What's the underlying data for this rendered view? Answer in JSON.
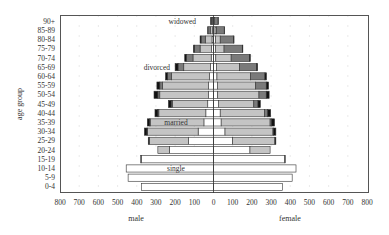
{
  "chart_data": {
    "type": "bar",
    "subtype": "population-pyramid-stacked",
    "title": "",
    "ylabel": "age group",
    "xlabel_left": "male",
    "xlabel_right": "female",
    "xlim": [
      -800,
      800
    ],
    "xticks": [
      "800",
      "700",
      "600",
      "500",
      "400",
      "300",
      "200",
      "100",
      "0",
      "100",
      "200",
      "300",
      "400",
      "500",
      "600",
      "700",
      "800"
    ],
    "grid": "dotted vertical",
    "legend": "inline annotations",
    "annotations": [
      {
        "text": "widowed",
        "age": "90+"
      },
      {
        "text": "divorced",
        "age": "65-69"
      },
      {
        "text": "married",
        "age": "35-39"
      },
      {
        "text": "single",
        "age": "10-14"
      }
    ],
    "categories": [
      "0-4",
      "5-9",
      "10-14",
      "15-19",
      "20-24",
      "25-29",
      "30-34",
      "35-39",
      "40-44",
      "45-49",
      "50-54",
      "55-59",
      "60-64",
      "65-69",
      "70-74",
      "75-79",
      "80-84",
      "85-89",
      "90+"
    ],
    "segment_order": [
      "single",
      "married",
      "widowed",
      "divorced"
    ],
    "colors": {
      "single": "#ffffff",
      "married": "#c4c4c4",
      "widowed": "#7a7a7a",
      "divorced": "#111111"
    },
    "male": {
      "single": [
        375,
        445,
        455,
        375,
        230,
        130,
        80,
        50,
        40,
        30,
        25,
        25,
        20,
        15,
        12,
        10,
        8,
        5,
        2
      ],
      "married": [
        0,
        0,
        0,
        5,
        60,
        205,
        265,
        280,
        245,
        185,
        255,
        240,
        200,
        140,
        95,
        60,
        35,
        12,
        2
      ],
      "widowed": [
        0,
        0,
        0,
        0,
        0,
        0,
        2,
        3,
        5,
        6,
        10,
        15,
        20,
        30,
        35,
        30,
        22,
        12,
        8
      ],
      "divorced": [
        0,
        0,
        0,
        0,
        0,
        5,
        13,
        12,
        15,
        14,
        20,
        15,
        10,
        15,
        8,
        5,
        5,
        1,
        3
      ]
    },
    "female": {
      "single": [
        360,
        410,
        430,
        370,
        190,
        100,
        60,
        40,
        35,
        25,
        22,
        20,
        18,
        15,
        12,
        10,
        10,
        8,
        3
      ],
      "married": [
        0,
        0,
        0,
        5,
        105,
        220,
        250,
        255,
        230,
        185,
        215,
        200,
        175,
        120,
        80,
        45,
        25,
        8,
        1
      ],
      "widowed": [
        0,
        0,
        0,
        0,
        0,
        0,
        3,
        8,
        18,
        22,
        38,
        55,
        75,
        90,
        95,
        95,
        70,
        40,
        20
      ],
      "divorced": [
        0,
        0,
        0,
        0,
        0,
        5,
        12,
        15,
        15,
        12,
        15,
        12,
        8,
        5,
        5,
        3,
        2,
        2,
        1
      ]
    }
  }
}
